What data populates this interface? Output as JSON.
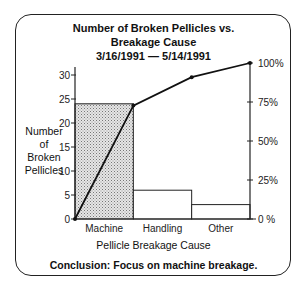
{
  "chart_data": {
    "type": "bar",
    "subtype": "pareto",
    "title_lines": [
      "Number of Broken Pellicles vs.",
      "Breakage Cause",
      "3/16/1991 — 5/14/1991"
    ],
    "xlabel": "Pellicle Breakage Cause",
    "ylabel_lines": [
      "Number",
      "of",
      "Broken",
      "Pellicles"
    ],
    "categories": [
      "Machine",
      "Handling",
      "Other"
    ],
    "values": [
      24,
      6,
      3
    ],
    "highlighted_category": "Machine",
    "cumulative_percent": [
      0,
      72.7,
      90.9,
      100
    ],
    "ylim": [
      0,
      32
    ],
    "yticks": [
      0,
      5,
      10,
      15,
      20,
      25,
      30
    ],
    "y2lim": [
      0,
      100
    ],
    "y2ticks": [
      0,
      25,
      50,
      75,
      100
    ],
    "y2tick_labels": [
      "0 %",
      "25%",
      "50%",
      "75%",
      "100%"
    ],
    "grid": false,
    "conclusion": "Conclusion:  Focus on machine breakage."
  }
}
